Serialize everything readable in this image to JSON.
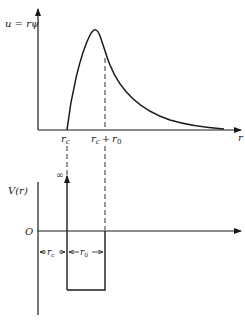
{
  "figure": {
    "top_plot": {
      "y_axis_label": "u = rψ",
      "x_axis_label": "r",
      "tick_labels": {
        "rc": "r",
        "rc_sub": "c",
        "rc_plus_r0_a": "r",
        "rc_plus_r0_a_sub": "c",
        "plus": "+",
        "rc_plus_r0_b": "r",
        "rc_plus_r0_b_sub": "0"
      },
      "curve_description": "Radial wavefunction u(r) rising from zero at r_c, peaking before r_c + r_0, then decaying exponentially"
    },
    "bottom_plot": {
      "y_axis_label": "V(r)",
      "origin_label": "O",
      "infinity_label": "∞",
      "dimension_labels": {
        "rc": "r",
        "rc_sub": "c",
        "r0": "r",
        "r0_sub": "0"
      },
      "potential_description": "Infinite hard core for r < r_c, square well of width r_0 beyond, zero outside"
    },
    "colors": {
      "ink": "#1a1a1a",
      "background": "#ffffff"
    }
  }
}
